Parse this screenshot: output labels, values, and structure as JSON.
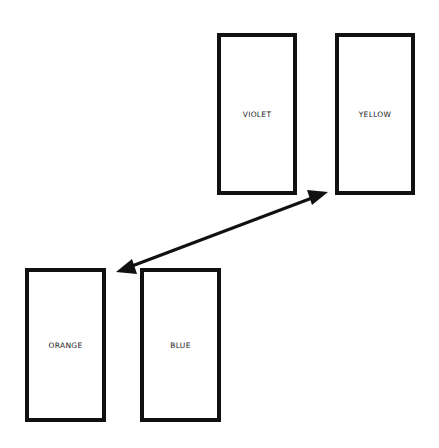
{
  "diagram": {
    "boxes": [
      {
        "id": "violet",
        "label": "VIOLET",
        "x": 217,
        "y": 33,
        "w": 80,
        "h": 162
      },
      {
        "id": "yellow",
        "label": "YELLOW",
        "x": 335,
        "y": 33,
        "w": 80,
        "h": 162
      },
      {
        "id": "orange",
        "label": "ORANGE",
        "x": 25,
        "y": 268,
        "w": 81,
        "h": 154
      },
      {
        "id": "blue",
        "label": "BLUE",
        "x": 140,
        "y": 268,
        "w": 81,
        "h": 154
      }
    ],
    "arrow": {
      "type": "double-headed",
      "from": "orange",
      "to": "yellow",
      "start": [
        116,
        272
      ],
      "end": [
        328,
        192
      ]
    },
    "colors": {
      "stroke": "#111111",
      "background": "#ffffff"
    }
  }
}
